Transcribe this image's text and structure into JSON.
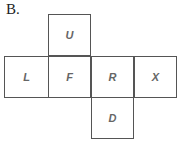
{
  "label": "B.",
  "faces": {
    "up": "U",
    "left": "L",
    "front": "F",
    "right": "R",
    "back": "X",
    "down": "D"
  }
}
